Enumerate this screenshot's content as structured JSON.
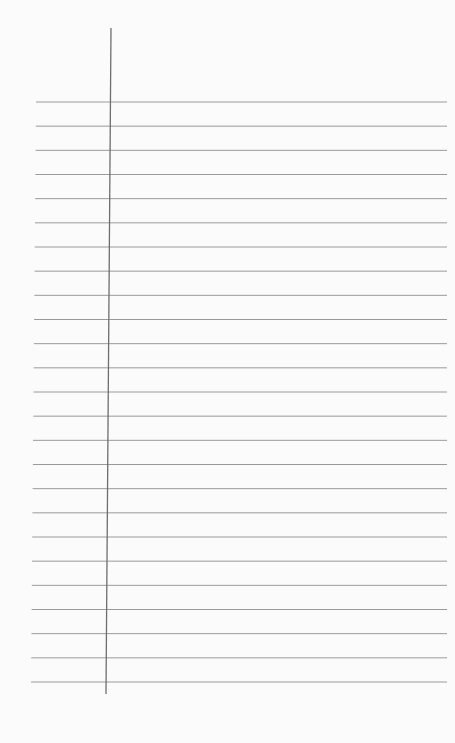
{
  "paper": {
    "type": "blank lined notebook page",
    "background": "#fbfbfb",
    "rule_color": "#9a9a9a",
    "margin_color": "#6e6e6e",
    "rule_count": 25,
    "first_rule_y": 102,
    "last_rule_y": 682,
    "margin_line": {
      "x_top": 111,
      "y_top": 28,
      "x_bottom": 106,
      "y_bottom": 694
    }
  }
}
